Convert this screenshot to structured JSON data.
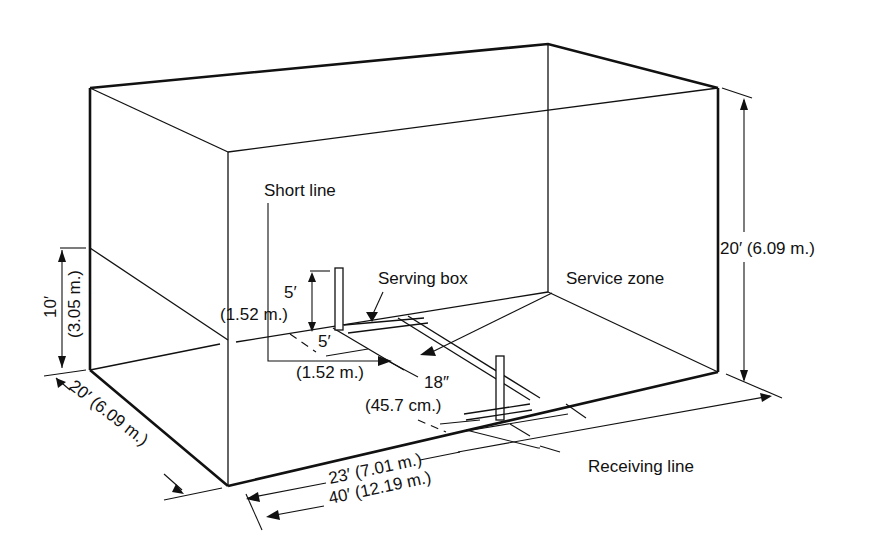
{
  "diagram": {
    "labels": {
      "short_line": "Short line",
      "serving_box": "Serving box",
      "service_zone": "Service zone",
      "receiving_line": "Receiving line",
      "height_total": "20′ (6.09 m.)",
      "back_wall_height_ft": "10′",
      "back_wall_height_m": "(3.05 m.)",
      "width_ft": "20′ (6.09 m.)",
      "length_total": "40′ (12.19 m.)",
      "receiving_distance": "23′ (7.01 m.)",
      "box_height_ft": "5′",
      "box_height_m": "(1.52 m.)",
      "box_width_ft": "5′",
      "box_width_m": "(1.52 m.)",
      "zone_depth_in": "18″",
      "zone_depth_cm": "(45.7 cm.)"
    }
  }
}
